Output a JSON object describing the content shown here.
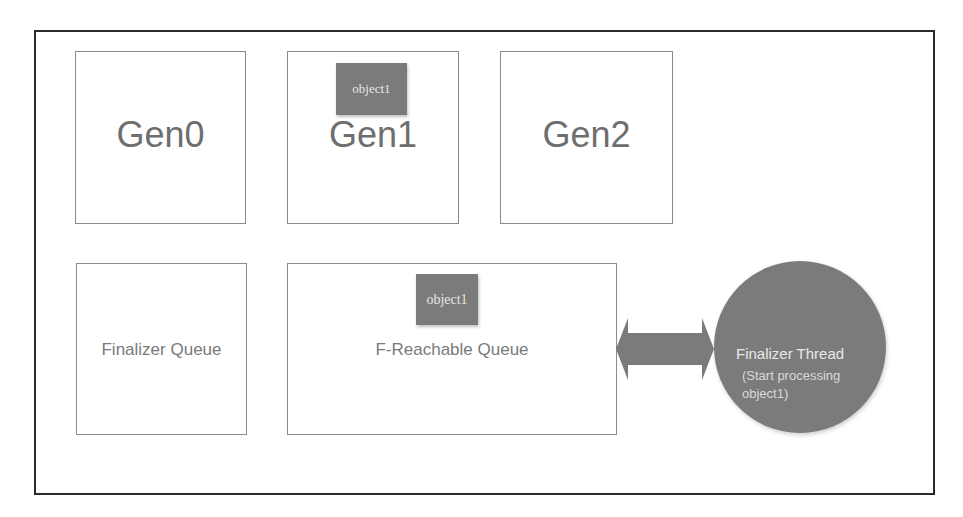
{
  "diagram": {
    "generations": [
      {
        "label": "Gen0",
        "contains": null
      },
      {
        "label": "Gen1",
        "contains": "object1"
      },
      {
        "label": "Gen2",
        "contains": null
      }
    ],
    "queues": [
      {
        "label": "Finalizer Queue",
        "contains": null
      },
      {
        "label": "F-Reachable Queue",
        "contains": "object1"
      }
    ],
    "arrow": {
      "type": "double-headed",
      "connects": [
        "F-Reachable Queue",
        "Finalizer Thread"
      ]
    },
    "finalizer_thread": {
      "title": "Finalizer Thread",
      "subtitle_line1": "(Start processing",
      "subtitle_line2": "object1)"
    },
    "colors": {
      "object_fill": "#7b7b7b",
      "object_text": "#e6e6e6",
      "box_border": "#8a8a8a",
      "frame_border": "#2b2b2b",
      "label_text": "#6e6e6e"
    }
  }
}
